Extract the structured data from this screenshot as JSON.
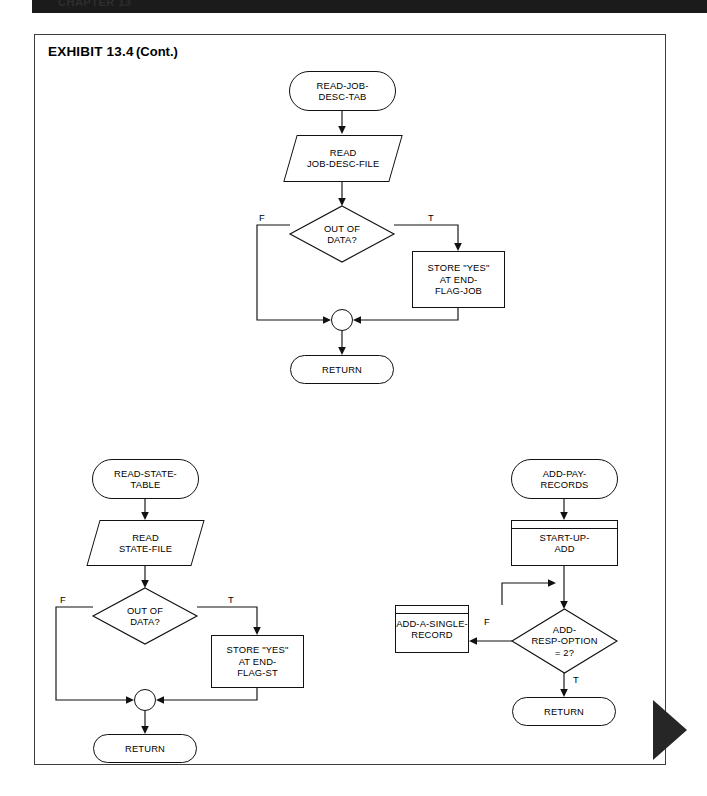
{
  "page": {
    "running_head": "CHAPTER 13",
    "corner_marker": "page-corner-triangle"
  },
  "exhibit": {
    "title": "EXHIBIT 13.4",
    "continued": "(Cont.)"
  },
  "flowcharts": [
    {
      "id": "read-job-desc-tab",
      "nodes": {
        "start": {
          "type": "terminal",
          "label": "READ-JOB-\nDESC-TAB"
        },
        "read": {
          "type": "io",
          "label": "READ\nJOB-DESC-FILE"
        },
        "decision": {
          "type": "decision",
          "label": "OUT OF\nDATA?"
        },
        "false_label": "F",
        "true_label": "T",
        "store": {
          "type": "process",
          "label": "STORE \"YES\"\nAT END-\nFLAG-JOB"
        },
        "merge": {
          "type": "connector",
          "label": ""
        },
        "return": {
          "type": "terminal",
          "label": "RETURN"
        }
      }
    },
    {
      "id": "read-state-table",
      "nodes": {
        "start": {
          "type": "terminal",
          "label": "READ-STATE-\nTABLE"
        },
        "read": {
          "type": "io",
          "label": "READ\nSTATE-FILE"
        },
        "decision": {
          "type": "decision",
          "label": "OUT OF\nDATA?"
        },
        "false_label": "F",
        "true_label": "T",
        "store": {
          "type": "process",
          "label": "STORE \"YES\"\nAT END-\nFLAG-ST"
        },
        "merge": {
          "type": "connector",
          "label": ""
        },
        "return": {
          "type": "terminal",
          "label": "RETURN"
        }
      }
    },
    {
      "id": "add-pay-records",
      "nodes": {
        "start": {
          "type": "terminal",
          "label": "ADD-PAY-\nRECORDS"
        },
        "startup": {
          "type": "predefined-process",
          "label": "START-UP-\nADD"
        },
        "decision": {
          "type": "decision",
          "label": "ADD-\nRESP-OPTION\n= 2?"
        },
        "false_label": "F",
        "true_label": "T",
        "single": {
          "type": "predefined-process",
          "label": "ADD-A-SINGLE-\nRECORD"
        },
        "return": {
          "type": "terminal",
          "label": "RETURN"
        }
      }
    }
  ],
  "colors": {
    "ink": "#111111",
    "frame": "#3d3d3d",
    "band": "#1b1b1b",
    "paper": "#ffffff"
  }
}
